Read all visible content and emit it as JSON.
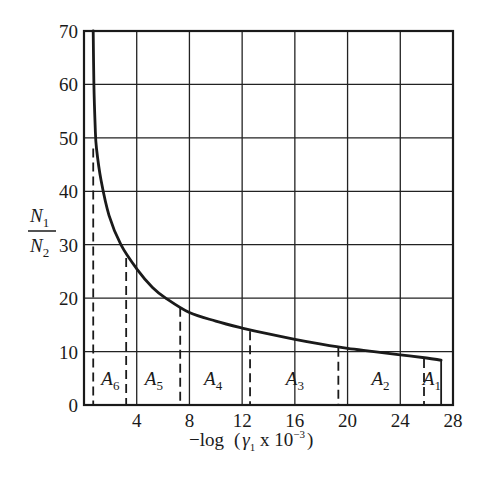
{
  "chart_data": {
    "type": "line",
    "title": "",
    "xlabel": "−log (γ₁ x 10⁻³)",
    "xlabel_parts": {
      "prefix": "−log",
      "open": "(",
      "gamma": "γ",
      "gamma_sub": "1",
      "mid": " x 10",
      "exp": "−3",
      "close": ")"
    },
    "ylabel": "N1/N2",
    "ylabel_parts": {
      "num": "N",
      "num_sub": "1",
      "den": "N",
      "den_sub": "2"
    },
    "xlim": [
      0,
      28
    ],
    "ylim": [
      0,
      70
    ],
    "grid": true,
    "x_ticks": [
      "4",
      "8",
      "12",
      "16",
      "20",
      "24",
      "28"
    ],
    "x_tick_values": [
      4,
      8,
      12,
      16,
      20,
      24,
      28
    ],
    "y_ticks": [
      "0",
      "10",
      "20",
      "30",
      "40",
      "50",
      "60",
      "70"
    ],
    "y_tick_values": [
      0,
      10,
      20,
      30,
      40,
      50,
      60,
      70
    ],
    "series": [
      {
        "name": "N1/N2 curve",
        "x": [
          0.7,
          0.75,
          0.85,
          0.95,
          1.3,
          1.9,
          2.8,
          4.0,
          5.2,
          6.2,
          8.0,
          10.0,
          12.0,
          14.0,
          16.0,
          18.0,
          20.0,
          22.0,
          24.0,
          26.0,
          27.1
        ],
        "y": [
          70,
          60,
          52,
          48,
          42,
          35.5,
          30,
          25.5,
          22,
          20,
          17.3,
          15.7,
          14.4,
          13.3,
          12.3,
          11.4,
          10.6,
          10.0,
          9.4,
          8.8,
          8.4
        ]
      }
    ],
    "dashed_dividers": [
      {
        "x": 0.7,
        "y_top": 48
      },
      {
        "x": 3.2,
        "y_top": 27.5
      },
      {
        "x": 7.3,
        "y_top": 18.2
      },
      {
        "x": 12.6,
        "y_top": 13.8
      },
      {
        "x": 19.3,
        "y_top": 10.7
      },
      {
        "x": 25.8,
        "y_top": 8.6
      }
    ],
    "end_line": {
      "x": 27.1,
      "y_top": 8.4
    },
    "regions": [
      {
        "label": "A",
        "sub": "6",
        "x_center": 2.0
      },
      {
        "label": "A",
        "sub": "5",
        "x_center": 5.3
      },
      {
        "label": "A",
        "sub": "4",
        "x_center": 9.8
      },
      {
        "label": "A",
        "sub": "3",
        "x_center": 16.0
      },
      {
        "label": "A",
        "sub": "2",
        "x_center": 22.5
      },
      {
        "label": "A",
        "sub": "1",
        "x_center": 26.4
      }
    ]
  }
}
